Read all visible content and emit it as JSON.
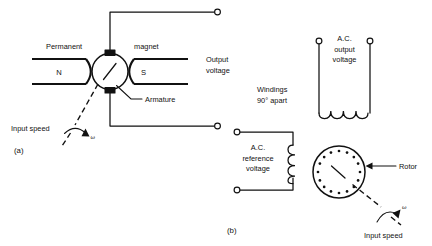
{
  "figure": {
    "panels": [
      {
        "id": "a",
        "caption": "(a)",
        "name": "dc-tachometer-generator",
        "labels": {
          "permanent": "Permanent",
          "magnet": "magnet",
          "pole_north": "N",
          "pole_south": "S",
          "armature": "Armature",
          "output_voltage_line1": "Output",
          "output_voltage_line2": "voltage",
          "input_speed": "Input speed",
          "omega": "ω"
        }
      },
      {
        "id": "b",
        "caption": "(b)",
        "name": "ac-tachometer-generator",
        "labels": {
          "windings_line1": "Windings",
          "windings_line2": "90° apart",
          "ac_output_line1": "A.C.",
          "ac_output_line2": "output",
          "ac_output_line3": "voltage",
          "ac_reference_line1": "A.C.",
          "ac_reference_line2": "reference",
          "ac_reference_line3": "voltage",
          "rotor": "Rotor",
          "input_speed": "Input speed",
          "omega": "ω"
        }
      }
    ],
    "colors": {
      "ink": "#111111",
      "background": "#ffffff"
    },
    "counts": {
      "rotor_bars": 16,
      "output_coil_turns": 4,
      "reference_coil_turns": 4
    }
  }
}
